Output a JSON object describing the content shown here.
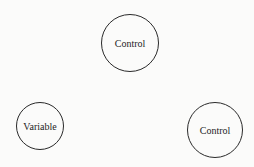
{
  "diagram": {
    "nodes": [
      {
        "id": "top",
        "label": "Control",
        "cx": 130,
        "cy": 43,
        "r": 29
      },
      {
        "id": "left",
        "label": "Variable",
        "cx": 40,
        "cy": 126,
        "r": 24
      },
      {
        "id": "right",
        "label": "Control",
        "cx": 215,
        "cy": 130,
        "r": 28
      }
    ],
    "colors": {
      "stroke": "#2a2a2a",
      "background": "#fbfbfa",
      "text": "#1e1e1e"
    }
  }
}
